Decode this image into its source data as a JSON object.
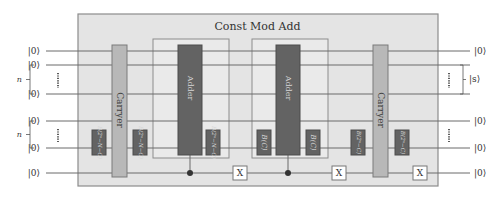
{
  "title": "Const Mod Add",
  "colors": {
    "outer_box_fill": "#e4e4e4",
    "outer_box_stroke": "#8c8c8c",
    "inner_box_fill": "#eaeaea",
    "inner_box_stroke": "#8c8c8c",
    "wire": "#6b6b6b",
    "dark_gate": "#636363",
    "dark_gate_text": "#d6d6d6",
    "carryer_fill": "#b8b8b8",
    "carryer_text": "#444444",
    "x_gate_fill": "#ffffff",
    "x_gate_stroke": "#777777",
    "control_dot": "#333333"
  },
  "wires": [
    {
      "y": 51,
      "in_label": "|0⟩",
      "out_label": "|0⟩"
    },
    {
      "y": 65,
      "in_label": "|0⟩",
      "out_label": ""
    },
    {
      "y": 94,
      "in_label": "|0⟩",
      "out_label": ""
    },
    {
      "y": 121,
      "in_label": "|0⟩",
      "out_label": "|0⟩"
    },
    {
      "y": 148,
      "in_label": "|0⟩",
      "out_label": "|0⟩"
    },
    {
      "y": 173,
      "in_label": "|0⟩",
      "out_label": "|0⟩"
    }
  ],
  "input_braces": [
    {
      "label": "n",
      "y1": 65,
      "y2": 94
    },
    {
      "label": "n",
      "y1": 121,
      "y2": 148
    }
  ],
  "output_braces": [
    {
      "label": "|s⟩",
      "y1": 65,
      "y2": 94
    }
  ],
  "gates": {
    "carryer_label": "Carryer",
    "adder_label": "Adder",
    "b_2n_minus_N_minus_C": "B(2ⁿ−N−C)",
    "b_C": "B(C)",
    "b_2n_minus_C": "B(2ⁿ−C)",
    "x_label": "X"
  },
  "layout": {
    "outer_box": {
      "x": 78,
      "y": 14,
      "w": 360,
      "h": 172
    },
    "inner_boxes": [
      {
        "x": 153,
        "y": 39,
        "w": 76,
        "h": 119
      },
      {
        "x": 252,
        "y": 39,
        "w": 76,
        "h": 119
      }
    ],
    "carryers": [
      {
        "x": 112,
        "y": 45,
        "w": 15,
        "h": 132
      },
      {
        "x": 373,
        "y": 45,
        "w": 15,
        "h": 132
      }
    ],
    "adders": [
      {
        "x": 178,
        "y": 45,
        "w": 24,
        "h": 110
      },
      {
        "x": 276,
        "y": 45,
        "w": 24,
        "h": 110
      }
    ],
    "small_gates": [
      {
        "x": 92,
        "label_key": "b_2n_minus_N_minus_C"
      },
      {
        "x": 133,
        "label_key": "b_2n_minus_N_minus_C"
      },
      {
        "x": 206,
        "label_key": "b_2n_minus_N_minus_C"
      },
      {
        "x": 257,
        "label_key": "b_C"
      },
      {
        "x": 306,
        "label_key": "b_C"
      },
      {
        "x": 351,
        "label_key": "b_2n_minus_C"
      },
      {
        "x": 395,
        "label_key": "b_2n_minus_C"
      }
    ],
    "controls": [
      {
        "x": 190,
        "from_y": 155,
        "to_y": 173
      },
      {
        "x": 288,
        "from_y": 155,
        "to_y": 173
      }
    ],
    "x_gates": [
      {
        "x": 240,
        "y": 173
      },
      {
        "x": 339,
        "y": 173
      },
      {
        "x": 420,
        "y": 173
      }
    ]
  }
}
